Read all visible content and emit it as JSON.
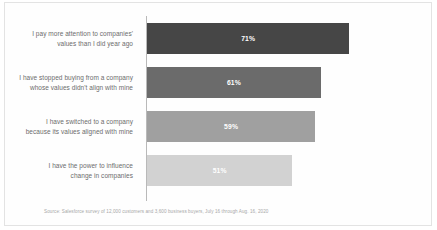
{
  "chart_data": {
    "type": "bar",
    "orientation": "horizontal",
    "title": "",
    "xlabel": "",
    "ylabel": "",
    "xlim": [
      0,
      100
    ],
    "grid": false,
    "legend": false,
    "value_suffix": "%",
    "categories": [
      "I pay more attention to companies' values than I did year ago",
      "I have stopped buying from a company whose values didn't align with mine",
      "I have switched to a company because its values aligned with mine",
      "I have the power to influence change in companies"
    ],
    "category_lines": [
      [
        "I pay more attention to companies'",
        "values than I did year ago"
      ],
      [
        "I have stopped buying from a company",
        "whose values didn't align with mine"
      ],
      [
        "I have switched to a company",
        "because its values aligned with mine"
      ],
      [
        "I have the power to influence",
        "change in companies"
      ]
    ],
    "values": [
      71,
      61,
      59,
      51
    ],
    "value_labels": [
      "71%",
      "61%",
      "59%",
      "51%"
    ],
    "bar_colors": [
      "#464646",
      "#6b6b6b",
      "#a0a0a0",
      "#d2d2d2"
    ],
    "source": "Source: Salesforce survey of 12,000 customers and 3,600 business buyers, July 16 through Aug. 16, 2020"
  },
  "colors": {
    "background": "#fefefe",
    "border": "#e3e3e3",
    "axis": "#b9b9b9",
    "label_text": "#6c6c6c",
    "value_text": "#ffffff",
    "source_text": "#a8a8a8"
  }
}
